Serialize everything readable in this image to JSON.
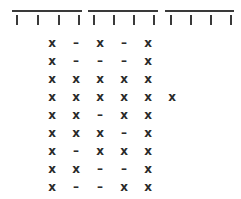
{
  "figure": {
    "background_color": "#ffffff",
    "ink_color": "#2a2a2a",
    "rule_color": "#3a3a3a"
  },
  "scale": {
    "name": "segmented-scale-header",
    "segment_count": 3,
    "segments": [
      {
        "label": "segment-1",
        "left": 12,
        "width": 70
      },
      {
        "label": "segment-2",
        "left": 88,
        "width": 70
      },
      {
        "label": "segment-3",
        "left": 165,
        "width": 69
      }
    ],
    "tick_count": 12,
    "ticks": [
      {
        "label": "tick-1",
        "left": 16
      },
      {
        "label": "tick-2",
        "left": 37
      },
      {
        "label": "tick-3",
        "left": 58
      },
      {
        "label": "tick-4",
        "left": 78
      },
      {
        "label": "tick-5",
        "left": 93
      },
      {
        "label": "tick-6",
        "left": 113
      },
      {
        "label": "tick-7",
        "left": 133
      },
      {
        "label": "tick-8",
        "left": 153
      },
      {
        "label": "tick-9",
        "left": 170
      },
      {
        "label": "tick-10",
        "left": 190
      },
      {
        "label": "tick-11",
        "left": 210
      },
      {
        "label": "tick-12",
        "left": 230
      }
    ]
  },
  "grid": {
    "name": "symbol-matrix",
    "row_count": 9,
    "row_height": 18,
    "first_row_top": 6,
    "column_left_origin": 45,
    "column_step": 24,
    "symbols_legend": {
      "present": "x",
      "absent": "–"
    },
    "rows": [
      {
        "id": "row-1",
        "cells": [
          "x",
          "–",
          "x",
          "–",
          "x"
        ]
      },
      {
        "id": "row-2",
        "cells": [
          "x",
          "–",
          "–",
          "–",
          "x"
        ]
      },
      {
        "id": "row-3",
        "cells": [
          "x",
          "x",
          "x",
          "x",
          "x"
        ]
      },
      {
        "id": "row-4",
        "cells": [
          "x",
          "x",
          "x",
          "x",
          "x",
          "x"
        ]
      },
      {
        "id": "row-5",
        "cells": [
          "x",
          "x",
          "–",
          "x",
          "x"
        ]
      },
      {
        "id": "row-6",
        "cells": [
          "x",
          "x",
          "x",
          "–",
          "x"
        ]
      },
      {
        "id": "row-7",
        "cells": [
          "x",
          "–",
          "x",
          "x",
          "x"
        ]
      },
      {
        "id": "row-8",
        "cells": [
          "x",
          "x",
          "–",
          "–",
          "x"
        ]
      },
      {
        "id": "row-9",
        "cells": [
          "x",
          "–",
          "–",
          "x",
          "x"
        ]
      }
    ]
  }
}
